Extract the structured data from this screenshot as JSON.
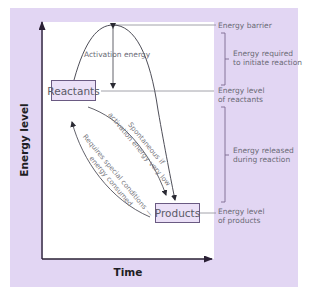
{
  "diagram": {
    "title": "",
    "axes": {
      "y_label": "Energy level",
      "x_label": "Time"
    },
    "nodes": {
      "reactants": "Reactants",
      "products": "Products"
    },
    "curve_labels": {
      "activation": "Activation energy",
      "spontaneous_line1": "Spontaneous if",
      "spontaneous_line2": "activation energy very low",
      "requires_line1": "Requires special conditions —",
      "requires_line2": "energy consumed"
    },
    "side_labels": {
      "energy_barrier": "Energy barrier",
      "energy_required_line1": "Energy required",
      "energy_required_line2": "to initiate reaction",
      "reactant_level_line1": "Energy level",
      "reactant_level_line2": "of reactants",
      "energy_released_line1": "Energy released",
      "energy_released_line2": "during reaction",
      "product_level_line1": "Energy level",
      "product_level_line2": "of products"
    },
    "colors": {
      "panel": "#e2d6f3",
      "box_fill": "#ebe0f7",
      "box_border": "#6a5a82",
      "line": "#4a4a55",
      "axis": "#2a2035",
      "text": "#6a6a75"
    }
  }
}
